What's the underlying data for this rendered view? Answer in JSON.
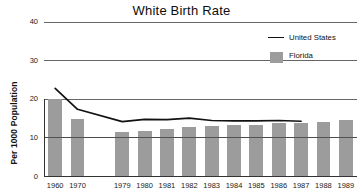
{
  "chart_data": {
    "type": "bar",
    "title": "White Birth Rate",
    "xlabel": "",
    "ylabel": "Per 1000 Population",
    "categories": [
      "1960",
      "1970",
      "",
      "1979",
      "1980",
      "1981",
      "1982",
      "1983",
      "1984",
      "1985",
      "1986",
      "1987",
      "1988",
      "1989"
    ],
    "ylim": [
      0,
      40
    ],
    "yticks": [
      0,
      10,
      20,
      30,
      40
    ],
    "ytick_labels": [
      "0",
      "10",
      "20",
      "30",
      "40"
    ],
    "grid": true,
    "legend_position": "top-right",
    "series": [
      {
        "name": "Florida",
        "type": "bar",
        "color": "#9c9c9c",
        "values": [
          20.0,
          15.0,
          null,
          11.5,
          11.8,
          12.2,
          12.8,
          13.0,
          13.4,
          13.4,
          13.9,
          13.9,
          14.1,
          14.6
        ]
      },
      {
        "name": "United States",
        "type": "line",
        "color": "#111111",
        "values": [
          22.8,
          17.4,
          null,
          14.2,
          14.8,
          14.7,
          15.1,
          14.5,
          14.4,
          14.4,
          14.5,
          14.3,
          null,
          null
        ]
      }
    ]
  },
  "legend": {
    "entries": [
      {
        "label": "United States",
        "marker": "line"
      },
      {
        "label": "Florida",
        "marker": "box"
      }
    ]
  }
}
